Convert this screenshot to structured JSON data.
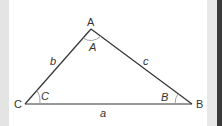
{
  "diagram": {
    "type": "triangle",
    "vertices": [
      {
        "name": "A",
        "label": "A",
        "x": 91,
        "y": 29
      },
      {
        "name": "B",
        "label": "B",
        "x": 192,
        "y": 104
      },
      {
        "name": "C",
        "label": "C",
        "x": 25,
        "y": 104
      }
    ],
    "sides": [
      {
        "name": "a",
        "label": "a",
        "between": "B-C"
      },
      {
        "name": "b",
        "label": "b",
        "between": "A-C"
      },
      {
        "name": "c",
        "label": "c",
        "between": "A-B"
      }
    ],
    "angles": [
      {
        "name": "A",
        "label": "A"
      },
      {
        "name": "B",
        "label": "B"
      },
      {
        "name": "C",
        "label": "C"
      }
    ],
    "colors": {
      "line": "#333333",
      "arc": "#999999",
      "text": "#333333",
      "background": "#ffffff",
      "side_strip": "#e4e4e4",
      "dark_strip": "#3a3a3a"
    }
  }
}
